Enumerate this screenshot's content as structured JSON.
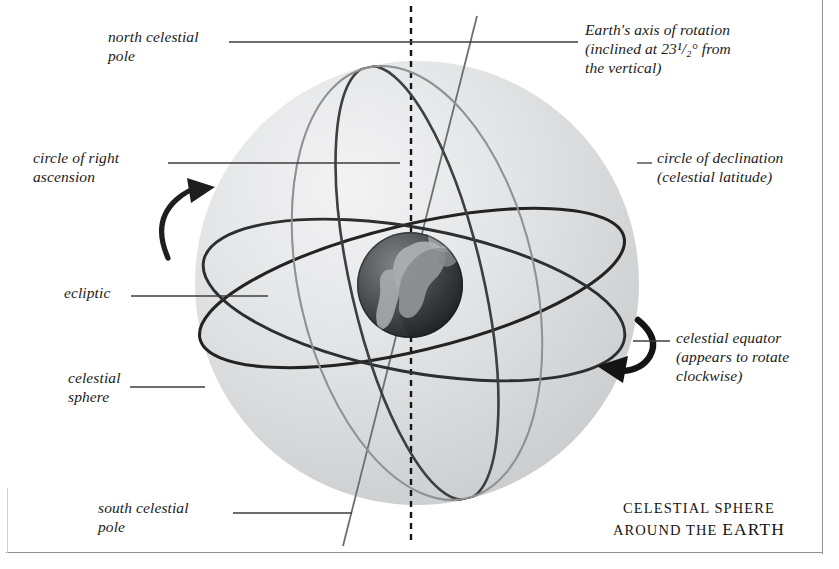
{
  "figure": {
    "caption_line1": "CELESTIAL SPHERE",
    "caption_line2_pre": "AROUND THE ",
    "caption_line2_word": "EARTH"
  },
  "labels": {
    "north_celestial_pole": "north celestial\npole",
    "circle_of_right_ascension": "circle of right\nascension",
    "ecliptic": "ecliptic",
    "celestial_sphere": "celestial\nsphere",
    "south_celestial_pole": "south celestial\npole",
    "earth_axis": "Earth's axis of rotation\n(inclined at 23¹/₂° from\nthe vertical)",
    "circle_of_declination": "circle of declination\n(celestial latitude)",
    "celestial_equator": "celestial equator\n(appears to rotate\nclockwise)"
  },
  "colors": {
    "sphere_fill": "#d8d9da",
    "sphere_highlight": "#f0f0f1",
    "earth_dark": "#2e3033",
    "earth_land": "#b9bcbe",
    "ring_dark": "#1d1d1d",
    "ring_mid": "#555759",
    "ring_light": "#a7a9ab",
    "leader_line": "#3a3a3a",
    "frame": "#8f9195",
    "background": "#ffffff"
  },
  "geometry": {
    "sphere_center_x": 417,
    "sphere_center_y": 283,
    "sphere_radius": 222,
    "earth_center_x": 410,
    "earth_center_y": 285,
    "earth_radius": 53,
    "axis_tilt_degrees": 23.5,
    "vertical_axis_x": 411,
    "north_pole_x": 476,
    "north_pole_y": 17,
    "south_pole_x": 344,
    "south_pole_y": 546
  }
}
